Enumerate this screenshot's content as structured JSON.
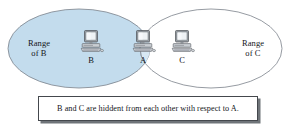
{
  "figure": {
    "background_color": "#ffffff",
    "width": 290,
    "height": 132
  },
  "ranges": [
    {
      "id": "range-b",
      "label": "Range\nof B",
      "fill_color": "#c3dced",
      "stroke_color": "#7b828a",
      "side": "left"
    },
    {
      "id": "range-c",
      "label": "Range\nof C",
      "fill_color": "#ffffff",
      "stroke_color": "#7b828a",
      "side": "right"
    }
  ],
  "nodes": [
    {
      "id": "node-b",
      "label": "B",
      "icon": "computer-icon",
      "inside": "range-b"
    },
    {
      "id": "node-a",
      "label": "A",
      "icon": "computer-icon",
      "inside": "range-b-and-range-c-overlap"
    },
    {
      "id": "node-c",
      "label": "C",
      "icon": "computer-icon",
      "inside": "range-c"
    }
  ],
  "caption": {
    "text": "B and C are hiddent from each other with respect to A.",
    "border_color": "#44484d",
    "shadow_color": "#6f7479",
    "background_color": "#ffffff"
  }
}
